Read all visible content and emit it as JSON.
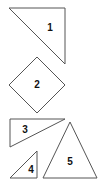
{
  "shapes": [
    {
      "id": 1,
      "label": "1",
      "type": "right-triangle",
      "points": "9,8 65,8 65,64",
      "label_pos": [
        50,
        28
      ]
    },
    {
      "id": 2,
      "label": "2",
      "type": "diamond",
      "points": "37,57 65,85 37,113 9,85",
      "label_pos": [
        37,
        85
      ]
    },
    {
      "id": 3,
      "label": "3",
      "type": "right-triangle",
      "points": "10,119 65,119 10,147",
      "label_pos": [
        25,
        130
      ]
    },
    {
      "id": 4,
      "label": "4",
      "type": "right-triangle",
      "points": "37,151 37,178 10,178",
      "label_pos": [
        31,
        170
      ]
    },
    {
      "id": 5,
      "label": "5",
      "type": "triangle",
      "points": "70,122 97,178 43,178",
      "label_pos": [
        70,
        162
      ]
    }
  ],
  "colors": {
    "stroke": "#555555",
    "fill": "#ffffff",
    "text": "#111111"
  }
}
